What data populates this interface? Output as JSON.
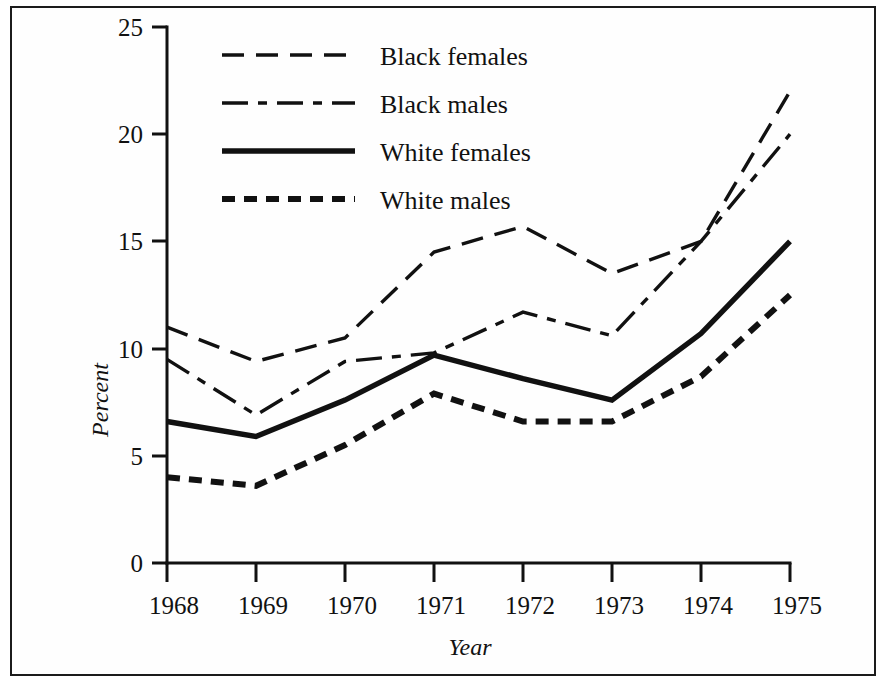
{
  "chart_data": {
    "type": "line",
    "title": "",
    "xlabel": "Year",
    "ylabel": "Percent",
    "x": [
      1968,
      1969,
      1970,
      1971,
      1972,
      1973,
      1974,
      1975
    ],
    "xtick_labels": [
      "1968",
      "1969",
      "1970",
      "1971",
      "1972",
      "1973",
      "1974",
      "1975"
    ],
    "ytick_labels": [
      "0",
      "5",
      "10",
      "15",
      "20",
      "25"
    ],
    "ytick_values": [
      0,
      5,
      10,
      15,
      20,
      25
    ],
    "xlim": [
      1968,
      1975
    ],
    "ylim": [
      0,
      25
    ],
    "grid": false,
    "legend_position": "upper-left-inside",
    "series": [
      {
        "name": "Black females",
        "style": "long-dash",
        "color": "#111111",
        "values": [
          11.0,
          9.4,
          10.5,
          14.5,
          15.7,
          13.5,
          15.0,
          22.0
        ]
      },
      {
        "name": "Black males",
        "style": "dash-dot",
        "color": "#111111",
        "values": [
          9.5,
          6.9,
          9.4,
          9.8,
          11.7,
          10.6,
          15.0,
          20.0
        ]
      },
      {
        "name": "White females",
        "style": "solid",
        "color": "#111111",
        "values": [
          6.6,
          5.9,
          7.6,
          9.7,
          8.6,
          7.6,
          10.7,
          15.0
        ]
      },
      {
        "name": "White males",
        "style": "short-dash-thick",
        "color": "#111111",
        "values": [
          4.0,
          3.6,
          5.5,
          7.9,
          6.6,
          6.6,
          8.7,
          12.5
        ]
      }
    ]
  },
  "axes": {
    "y_title": "Percent",
    "x_title": "Year",
    "y_ticks": [
      "25",
      "20",
      "15",
      "10",
      "5",
      "0"
    ],
    "x_ticks": [
      "1968",
      "1969",
      "1970",
      "1971",
      "1972",
      "1973",
      "1974",
      "1975"
    ]
  },
  "legend": {
    "items": [
      {
        "label": "Black females"
      },
      {
        "label": "Black males"
      },
      {
        "label": "White females"
      },
      {
        "label": "White males"
      }
    ]
  },
  "colors": {
    "ink": "#111111",
    "paper": "#ffffff",
    "frame": "#1b1b1b"
  }
}
